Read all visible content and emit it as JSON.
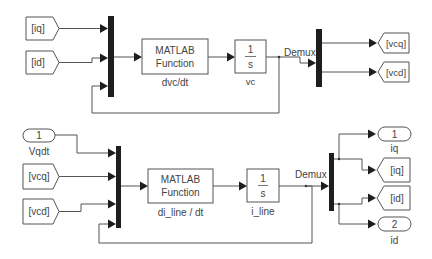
{
  "colors": {
    "background": "#ffffff",
    "line": "#555555",
    "bar": "#1e1e1e",
    "text": "#444444"
  },
  "top": {
    "from_iq": "[iq]",
    "from_id": "[id]",
    "fcn_line1": "MATLAB",
    "fcn_line2": "Function",
    "fcn_name": "dvc/dt",
    "int_num": "1",
    "int_den": "s",
    "int_name": "vc",
    "demux_label": "Demux",
    "goto_vcq": "[vcq]",
    "goto_vcd": "[vcd]"
  },
  "bottom": {
    "inport_num": "1",
    "inport_name": "Vqdt",
    "from_vcq": "[vcq]",
    "from_vcd": "[vcd]",
    "fcn_line1": "MATLAB",
    "fcn_line2": "Function",
    "fcn_name": "di_line / dt",
    "int_num": "1",
    "int_den": "s",
    "int_name": "i_line",
    "demux_label": "Demux",
    "outport1_num": "1",
    "outport1_name": "iq",
    "goto_iq": "[iq]",
    "goto_id": "[id]",
    "outport2_num": "2",
    "outport2_name": "id"
  }
}
